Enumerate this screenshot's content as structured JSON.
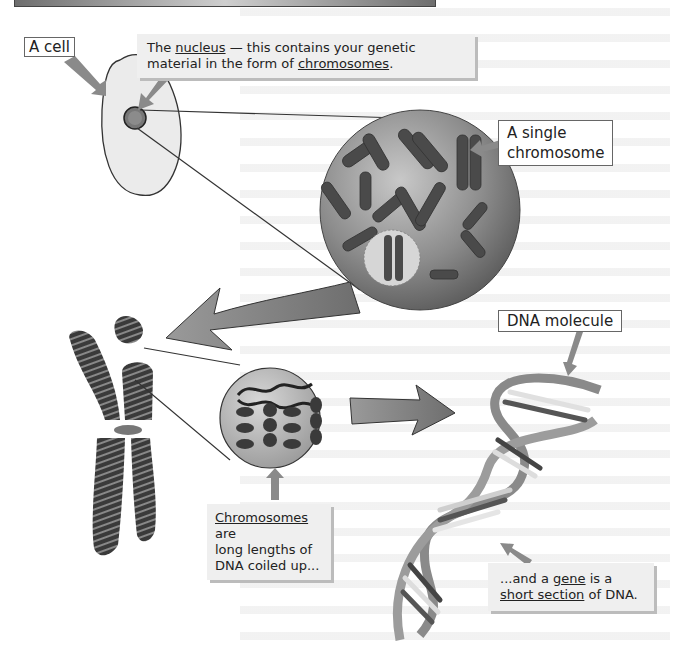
{
  "diagram": {
    "topic": "From cell to gene",
    "labels": {
      "cell": "A cell",
      "single_chromosome_line1": "A single",
      "single_chromosome_line2": "chromosome",
      "dna_molecule": "DNA molecule"
    },
    "callouts": {
      "nucleus": {
        "pre": "The ",
        "term": "nucleus",
        "mid": " — this contains your genetic",
        "line2_pre": "material in the form of ",
        "term2": "chromosomes",
        "end": "."
      },
      "chromosomes": {
        "term": "Chromosomes",
        "line1_rest": " are",
        "line2": "long lengths of",
        "line3": "DNA coiled up..."
      },
      "gene": {
        "line1_pre": "...and a ",
        "term": "gene",
        "line1_rest": " is a",
        "term2": "short section",
        "line2_rest": " of DNA."
      }
    },
    "elements": [
      "cell",
      "nucleus",
      "nucleus-zoom-with-chromosomes",
      "single-chromosome",
      "condensed-chromosome",
      "coiled-dna-zoom",
      "dna-double-helix"
    ],
    "colors": {
      "arrow": "#808080",
      "callout_bg": "#efefef",
      "cell_fill": "#ebebeb",
      "nucleus_sphere": "#8a8a8a",
      "chromosome": "#555555"
    }
  }
}
